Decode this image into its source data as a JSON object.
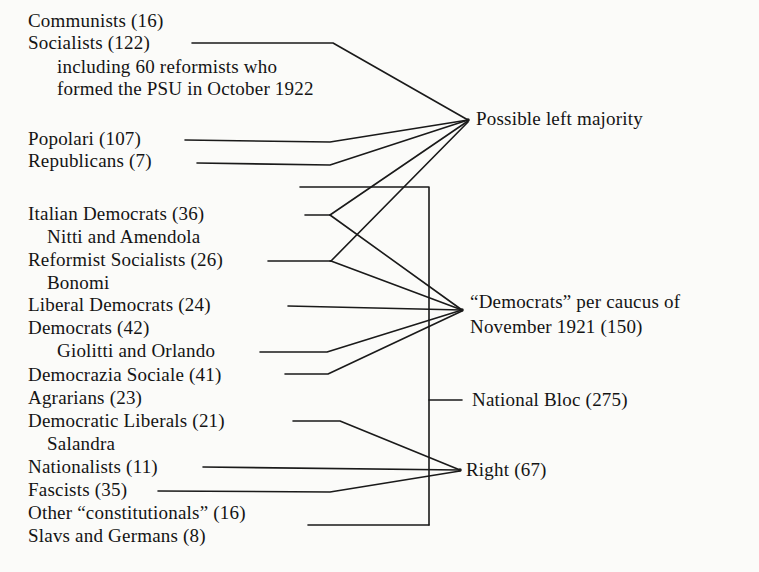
{
  "diagram": {
    "type": "bracket-flow-diagram",
    "ink_color": "#1a1a1a",
    "paper_color": "#fbfbf9",
    "left_entries": [
      {
        "id": "communists",
        "label": "Communists  (16)",
        "seats": 16,
        "x": 28,
        "y": 10,
        "has_connector": false
      },
      {
        "id": "socialists",
        "label": "Socialists  (122)",
        "seats": 122,
        "x": 28,
        "y": 32,
        "has_connector": true
      },
      {
        "id": "socialists-note-1",
        "label": "including 60 reformists who",
        "x": 57,
        "y": 56,
        "has_connector": false
      },
      {
        "id": "socialists-note-2",
        "label": "formed the PSU in October 1922",
        "x": 57,
        "y": 78,
        "has_connector": false
      },
      {
        "id": "popolari",
        "label": "Popolari  (107)",
        "seats": 107,
        "x": 28,
        "y": 128,
        "has_connector": true
      },
      {
        "id": "republicans",
        "label": "Republicans  (7)",
        "seats": 7,
        "x": 28,
        "y": 150,
        "has_connector": true
      },
      {
        "id": "italian-democrats",
        "label": "Italian Democrats  (36)",
        "seats": 36,
        "x": 28,
        "y": 203,
        "has_connector": true
      },
      {
        "id": "nitti-amendola",
        "label": "Nitti and Amendola",
        "x": 47,
        "y": 226,
        "has_connector": false
      },
      {
        "id": "reformist-socialists",
        "label": "Reformist Socialists  (26)",
        "seats": 26,
        "x": 28,
        "y": 249,
        "has_connector": true
      },
      {
        "id": "bonomi",
        "label": "Bonomi",
        "x": 47,
        "y": 272,
        "has_connector": false
      },
      {
        "id": "liberal-democrats",
        "label": "Liberal Democrats  (24)",
        "seats": 24,
        "x": 28,
        "y": 294,
        "has_connector": true
      },
      {
        "id": "democrats",
        "label": "Democrats  (42)",
        "seats": 42,
        "x": 28,
        "y": 317,
        "has_connector": false
      },
      {
        "id": "giolitti-orlando",
        "label": "Giolitti and Orlando",
        "x": 57,
        "y": 340,
        "has_connector": true
      },
      {
        "id": "democrazia-sociale",
        "label": "Democrazia Sociale  (41)",
        "seats": 41,
        "x": 28,
        "y": 364,
        "has_connector": true
      },
      {
        "id": "agrarians",
        "label": "Agrarians  (23)",
        "seats": 23,
        "x": 28,
        "y": 387,
        "has_connector": false
      },
      {
        "id": "democratic-liberals",
        "label": "Democratic Liberals  (21)",
        "seats": 21,
        "x": 28,
        "y": 410,
        "has_connector": true
      },
      {
        "id": "salandra",
        "label": "Salandra",
        "x": 47,
        "y": 433,
        "has_connector": false
      },
      {
        "id": "nationalists",
        "label": "Nationalists  (11)",
        "seats": 11,
        "x": 28,
        "y": 456,
        "has_connector": true
      },
      {
        "id": "fascists",
        "label": "Fascists  (35)",
        "seats": 35,
        "x": 28,
        "y": 479,
        "has_connector": true
      },
      {
        "id": "other-constitutionals",
        "label": "Other “constitutionals”  (16)",
        "seats": 16,
        "x": 28,
        "y": 502,
        "has_connector": true
      },
      {
        "id": "slavs-germans",
        "label": "Slavs and Germans  (8)",
        "seats": 8,
        "x": 28,
        "y": 525,
        "has_connector": false
      }
    ],
    "right_groups": [
      {
        "id": "possible-left-majority",
        "label": "Possible left majority",
        "x": 476,
        "y": 108,
        "node_x": 468,
        "node_y": 120
      },
      {
        "id": "democrats-caucus-line1",
        "label": "“Democrats” per caucus of",
        "x": 470,
        "y": 291,
        "node_x": 462,
        "node_y": 310
      },
      {
        "id": "democrats-caucus-line2",
        "label": "November 1921 (150)",
        "x": 470,
        "y": 316
      },
      {
        "id": "national-bloc",
        "label": "National Bloc  (275)",
        "x": 472,
        "y": 389,
        "node_x": 430,
        "node_y": 400,
        "seats": 275
      },
      {
        "id": "right",
        "label": "Right  (67)",
        "x": 466,
        "y": 459,
        "node_x": 460,
        "node_y": 470,
        "seats": 67
      }
    ],
    "bracket": {
      "id": "national-bloc-bracket",
      "x": 429,
      "top_y": 187,
      "bottom_y": 525,
      "top_left_x": 300,
      "bottom_left_x": 308,
      "tick_x_end": 462,
      "tick_y": 400
    }
  }
}
